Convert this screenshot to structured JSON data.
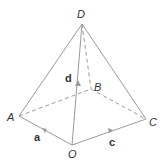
{
  "diagram": {
    "type": "pyramid-vectors",
    "points": {
      "D": {
        "label": "D",
        "x": 82,
        "y": 24
      },
      "B": {
        "label": "B",
        "x": 91,
        "y": 89
      },
      "A": {
        "label": "A",
        "x": 19,
        "y": 116
      },
      "C": {
        "label": "C",
        "x": 146,
        "y": 119
      },
      "O": {
        "label": "O",
        "x": 72,
        "y": 145
      }
    },
    "vectors": {
      "a": {
        "label": "a",
        "from": "O",
        "to": "A"
      },
      "c": {
        "label": "c",
        "from": "O",
        "to": "C"
      },
      "d": {
        "label": "d",
        "from": "O",
        "to": "D"
      }
    },
    "edges_solid": [
      "DA",
      "DC",
      "DO",
      "OA",
      "OC"
    ],
    "edges_dashed": [
      "DB",
      "AB",
      "BC"
    ],
    "colors": {
      "line": "#9a9a9a",
      "text": "#333333"
    }
  }
}
